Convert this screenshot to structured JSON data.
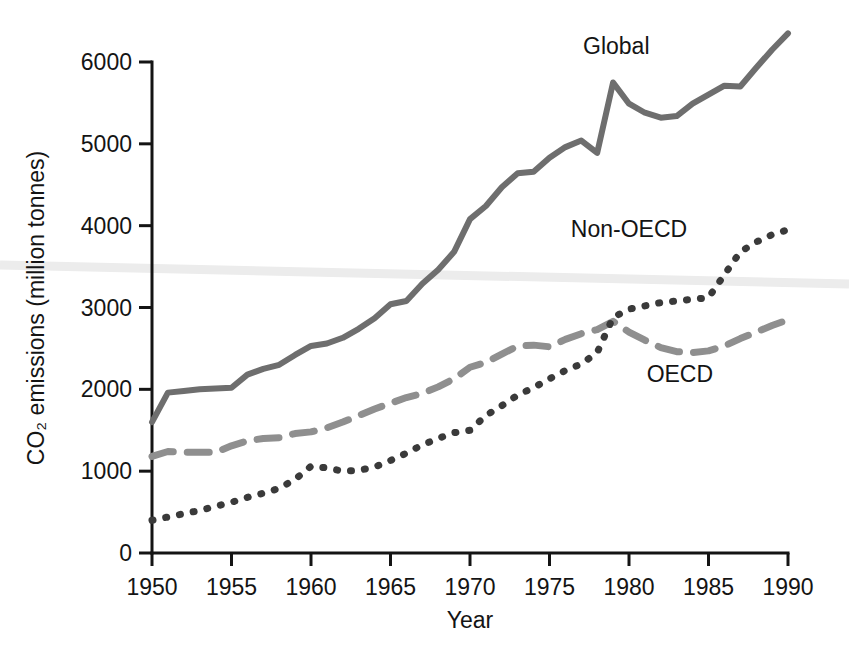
{
  "chart_data": {
    "type": "line",
    "title": "",
    "xlabel": "Year",
    "ylabel": "CO2 emissions (million tonnes)",
    "ylabel_display": "CO₂ emissions (million tonnes)",
    "xlim": [
      1950,
      1990
    ],
    "ylim": [
      0,
      6000
    ],
    "grid": false,
    "legend_position": "inline-annotations",
    "xticks": [
      1950,
      1955,
      1960,
      1965,
      1970,
      1975,
      1980,
      1985,
      1990
    ],
    "xtick_labels": [
      "1950",
      "1955",
      "1960",
      "1965",
      "1970",
      "1975",
      "1980",
      "1985",
      "1990"
    ],
    "yticks": [
      0,
      1000,
      2000,
      3000,
      4000,
      5000,
      6000
    ],
    "ytick_labels": [
      "0",
      "1000",
      "2000",
      "3000",
      "4000",
      "5000",
      "6000"
    ],
    "x": [
      1950,
      1951,
      1952,
      1953,
      1954,
      1955,
      1956,
      1957,
      1958,
      1959,
      1960,
      1961,
      1962,
      1963,
      1964,
      1965,
      1966,
      1967,
      1968,
      1969,
      1970,
      1971,
      1972,
      1973,
      1974,
      1975,
      1976,
      1977,
      1978,
      1979,
      1980,
      1981,
      1982,
      1983,
      1984,
      1985,
      1986,
      1987,
      1988,
      1989,
      1990
    ],
    "series": [
      {
        "name": "Global",
        "label": "Global",
        "color": "#6e6e6e",
        "style": "solid",
        "width": 6,
        "label_x": 1979.2,
        "label_y": 6190,
        "values": [
          1600,
          1960,
          1980,
          2000,
          2010,
          2020,
          2180,
          2250,
          2300,
          2420,
          2530,
          2560,
          2630,
          2740,
          2870,
          3040,
          3080,
          3290,
          3460,
          3680,
          4080,
          4240,
          4470,
          4640,
          4660,
          4830,
          4960,
          5040,
          4890,
          5750,
          5490,
          5380,
          5320,
          5340,
          5490,
          5600,
          5710,
          5700,
          5930,
          6150,
          6350
        ]
      },
      {
        "name": "OECD",
        "label": "OECD",
        "color": "#8f8f8f",
        "style": "dashed",
        "width": 7,
        "dash": "22 14",
        "label_x": 1983.2,
        "label_y": 2190,
        "values": [
          1180,
          1240,
          1230,
          1230,
          1230,
          1310,
          1370,
          1400,
          1410,
          1460,
          1480,
          1530,
          1600,
          1680,
          1760,
          1830,
          1900,
          1950,
          2030,
          2130,
          2270,
          2330,
          2430,
          2530,
          2540,
          2520,
          2610,
          2680,
          2730,
          2830,
          2700,
          2600,
          2510,
          2460,
          2450,
          2470,
          2530,
          2620,
          2700,
          2780,
          2850
        ]
      },
      {
        "name": "Non-OECD",
        "label": "Non-OECD",
        "color": "#3a3a3a",
        "style": "dotted",
        "width": 7,
        "dash": "1 13",
        "label_x": 1980.0,
        "label_y": 3960,
        "values": [
          400,
          440,
          480,
          520,
          570,
          620,
          680,
          730,
          790,
          900,
          1060,
          1040,
          1000,
          1010,
          1050,
          1130,
          1220,
          1320,
          1400,
          1470,
          1500,
          1680,
          1800,
          1930,
          2020,
          2130,
          2230,
          2310,
          2450,
          2880,
          2980,
          3020,
          3060,
          3080,
          3100,
          3120,
          3400,
          3680,
          3800,
          3890,
          3950
        ]
      }
    ],
    "artifact": {
      "name": "scan-artifact-line",
      "color": "#ececec",
      "left_y_px": 265,
      "right_y_px": 284
    }
  },
  "geometry": {
    "plot_left_px": 152,
    "plot_right_px": 788,
    "plot_top_px": 62,
    "plot_bottom_px": 553
  }
}
